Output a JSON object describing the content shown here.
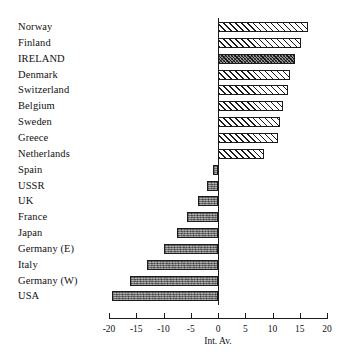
{
  "chart_data": {
    "type": "bar",
    "orientation": "horizontal",
    "title": "",
    "subtitle": "",
    "xlabel": "Int. Av.",
    "ylabel": "",
    "xlim": [
      -20,
      20
    ],
    "xticks": [
      -20,
      -15,
      -10,
      -5,
      0,
      5,
      10,
      15,
      20
    ],
    "xtick_labels": [
      "-20",
      "-15",
      "-10",
      "-5",
      "0",
      "5",
      "10",
      "15",
      "20"
    ],
    "grid": false,
    "legend": null,
    "zero_reference_label": "Int. Av.",
    "categories": [
      "Norway",
      "Finland",
      "IRELAND",
      "Denmark",
      "Switzerland",
      "Belgium",
      "Sweden",
      "Greece",
      "Netherlands",
      "Spain",
      "USSR",
      "UK",
      "France",
      "Japan",
      "Germany (E)",
      "Italy",
      "Germany (W)",
      "USA"
    ],
    "values": [
      16.5,
      15.3,
      14.2,
      13.2,
      12.8,
      12.0,
      11.3,
      11.0,
      8.4,
      -1.0,
      -2.1,
      -3.6,
      -5.6,
      -7.6,
      -10.0,
      -13.0,
      -16.2,
      -19.4
    ],
    "highlight_category": "IRELAND",
    "styles": {
      "positive_fill": "diagonal-hatch",
      "negative_fill": "mottled-grey",
      "highlight_fill": "dense-dark-crosshatch",
      "bar_outline_color": "#1b1b1b",
      "negative_bar_color": "#7d7d7d",
      "background_color": "#ffffff"
    }
  }
}
